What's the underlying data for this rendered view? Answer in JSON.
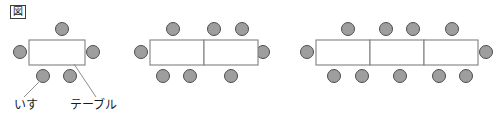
{
  "figure": {
    "marker": "図",
    "captions": {
      "chair": "いす",
      "table": "テーブル"
    },
    "colors": {
      "chair_fill": "#9e9e9e",
      "chair_stroke": "#4d4d4d",
      "table_fill": "#ffffff",
      "table_stroke": "#808080",
      "leader_line": "#8c8c8c",
      "text": "#1a1a1a",
      "background": "#ffffff"
    },
    "groups": [
      {
        "name": "group-1",
        "tables": 1,
        "chairs_total": 5,
        "chairs_top": 1,
        "chairs_bottom": 2,
        "chairs_left": 1,
        "chairs_right": 1
      },
      {
        "name": "group-2",
        "tables": 2,
        "chairs_total": 8,
        "chairs_top": 3,
        "chairs_bottom": 3,
        "chairs_left": 1,
        "chairs_right": 1
      },
      {
        "name": "group-3",
        "tables": 3,
        "chairs_total": 11,
        "chairs_top": 4,
        "chairs_bottom": 5,
        "chairs_left": 1,
        "chairs_right": 1
      }
    ],
    "geometry": {
      "chair_radius": 6.5,
      "table_height": 24,
      "table_unit_width": 54,
      "table_top_y": 40,
      "group_origins_x": [
        29,
        150,
        316
      ]
    }
  }
}
